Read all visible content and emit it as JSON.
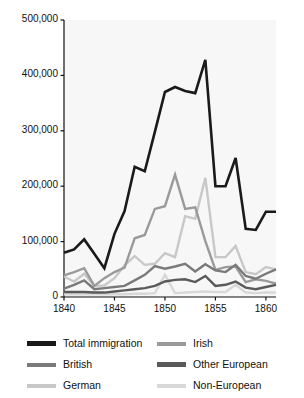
{
  "chart_data": {
    "type": "line",
    "title": "",
    "xlabel": "",
    "ylabel": "",
    "xlim": [
      1840,
      1861
    ],
    "ylim": [
      0,
      500000
    ],
    "grid": false,
    "legend_position": "bottom",
    "x_ticks": [
      "1840",
      "1845",
      "1850",
      "1855",
      "1860"
    ],
    "x_tick_values": [
      1840,
      1845,
      1850,
      1855,
      1860
    ],
    "y_ticks": [
      "0",
      "100,000",
      "200,000",
      "300,000",
      "400,000",
      "500,000"
    ],
    "y_tick_values": [
      0,
      100000,
      200000,
      300000,
      400000,
      500000
    ],
    "x": [
      1840,
      1841,
      1842,
      1843,
      1844,
      1845,
      1846,
      1847,
      1848,
      1849,
      1850,
      1851,
      1852,
      1853,
      1854,
      1855,
      1856,
      1857,
      1858,
      1859,
      1860,
      1861
    ],
    "series": [
      {
        "name": "Total immigration",
        "color": "#1a1a1a",
        "width": 2.6,
        "values": [
          80000,
          86000,
          104000,
          78000,
          52000,
          114000,
          155000,
          235000,
          227000,
          298000,
          370000,
          379000,
          372000,
          368000,
          428000,
          200000,
          200000,
          251000,
          123000,
          121000,
          154000,
          154000
        ]
      },
      {
        "name": "Irish",
        "color": "#9a9a9a",
        "width": 2.4,
        "values": [
          39000,
          45000,
          52000,
          20000,
          34000,
          45000,
          53000,
          106000,
          112000,
          159000,
          164000,
          221000,
          159000,
          162000,
          101000,
          49000,
          54000,
          55000,
          27000,
          32000,
          29000,
          24000
        ]
      },
      {
        "name": "German",
        "color": "#c8c8c8",
        "width": 2.4,
        "values": [
          37000,
          28000,
          42000,
          20000,
          21000,
          34000,
          57000,
          74000,
          58000,
          60000,
          79000,
          72000,
          146000,
          141000,
          215000,
          72000,
          72000,
          92000,
          45000,
          41000,
          54000,
          50000
        ]
      },
      {
        "name": "British",
        "color": "#7a7a7a",
        "width": 2.4,
        "values": [
          15000,
          22000,
          30000,
          14000,
          16000,
          18000,
          20000,
          30000,
          40000,
          56000,
          51000,
          55000,
          60000,
          46000,
          59000,
          48000,
          45000,
          58000,
          38000,
          33000,
          42000,
          50000
        ]
      },
      {
        "name": "Other European",
        "color": "#5a5a5a",
        "width": 2.4,
        "values": [
          9000,
          9000,
          9000,
          8000,
          8000,
          10000,
          12000,
          14000,
          16000,
          20000,
          28000,
          31000,
          32000,
          27000,
          38000,
          20000,
          22000,
          28000,
          17000,
          14000,
          18000,
          22000
        ]
      },
      {
        "name": "Non-European",
        "color": "#d8d8d8",
        "width": 2.4,
        "values": [
          5000,
          5000,
          5000,
          5000,
          5000,
          5000,
          5000,
          6000,
          6000,
          7000,
          40000,
          7000,
          8000,
          9000,
          10000,
          9000,
          9000,
          22000,
          8000,
          7000,
          8000,
          8000
        ]
      }
    ]
  },
  "legend": {
    "columns": [
      {
        "items": [
          {
            "label": "Total immigration",
            "color": "#1a1a1a",
            "thick": true
          },
          {
            "label": "British",
            "color": "#7a7a7a",
            "thick": false
          },
          {
            "label": "German",
            "color": "#c8c8c8",
            "thick": false
          }
        ]
      },
      {
        "items": [
          {
            "label": "Irish",
            "color": "#9a9a9a",
            "thick": false
          },
          {
            "label": "Other European",
            "color": "#5a5a5a",
            "thick": true
          },
          {
            "label": "Non-European",
            "color": "#d8d8d8",
            "thick": false
          }
        ]
      }
    ]
  },
  "colors": {
    "axis": "#111111",
    "plot_background": "#f7f7f7",
    "page_background": "#ffffff"
  }
}
